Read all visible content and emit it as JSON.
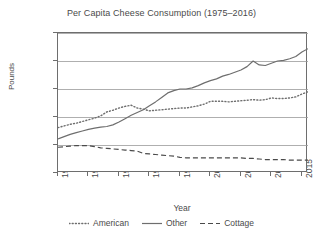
{
  "chart_data": {
    "type": "line",
    "title": "Per Capita Cheese Consumption (1975–2016)",
    "xlabel": "Year",
    "ylabel": "Pounds",
    "xlim": [
      1975,
      2016
    ],
    "ylim": [
      0.0,
      25.0
    ],
    "grid": "horizontal",
    "legend_position": "bottom",
    "y_ticks": [
      "0.0",
      "5.0",
      "10.0",
      "15.0",
      "20.0",
      "25.0"
    ],
    "y_tick_values": [
      0.0,
      5.0,
      10.0,
      15.0,
      20.0,
      25.0
    ],
    "x_ticks": [
      "1975",
      "1980",
      "1985",
      "1990",
      "1995",
      "2000",
      "2005",
      "2010",
      "2015"
    ],
    "x_tick_values": [
      1975,
      1980,
      1985,
      1990,
      1995,
      2000,
      2005,
      2010,
      2015
    ],
    "x": [
      1975,
      1976,
      1977,
      1978,
      1979,
      1980,
      1981,
      1982,
      1983,
      1984,
      1985,
      1986,
      1987,
      1988,
      1989,
      1990,
      1991,
      1992,
      1993,
      1994,
      1995,
      1996,
      1997,
      1998,
      1999,
      2000,
      2001,
      2002,
      2003,
      2004,
      2005,
      2006,
      2007,
      2008,
      2009,
      2010,
      2011,
      2012,
      2013,
      2014,
      2015,
      2016
    ],
    "series": [
      {
        "name": "American",
        "style": "dotted",
        "color": "#6e6e6e",
        "values": [
          8.1,
          8.4,
          8.7,
          8.9,
          9.2,
          9.5,
          9.8,
          10.2,
          10.9,
          11.2,
          11.6,
          11.9,
          12.1,
          11.6,
          11.4,
          11.1,
          11.2,
          11.3,
          11.4,
          11.5,
          11.6,
          11.6,
          11.8,
          12.0,
          12.3,
          12.8,
          12.8,
          12.8,
          12.7,
          12.8,
          12.9,
          13.0,
          13.1,
          13.0,
          13.1,
          13.4,
          13.3,
          13.3,
          13.4,
          13.6,
          14.1,
          14.5
        ]
      },
      {
        "name": "Other",
        "style": "solid",
        "color": "#6e6e6e",
        "values": [
          6.1,
          6.5,
          6.9,
          7.2,
          7.5,
          7.8,
          8.0,
          8.2,
          8.3,
          8.6,
          9.1,
          9.7,
          10.3,
          10.8,
          11.3,
          12.0,
          12.7,
          13.5,
          14.3,
          14.7,
          15.0,
          15.0,
          15.2,
          15.6,
          16.1,
          16.5,
          16.8,
          17.3,
          17.6,
          18.0,
          18.4,
          19.0,
          20.0,
          19.3,
          19.2,
          19.6,
          20.0,
          20.1,
          20.4,
          20.8,
          21.6,
          22.2
        ]
      },
      {
        "name": "Cottage",
        "style": "dashed",
        "color": "#4a4a4a",
        "values": [
          4.6,
          4.7,
          4.8,
          4.9,
          4.9,
          4.9,
          4.7,
          4.5,
          4.4,
          4.3,
          4.2,
          4.1,
          4.0,
          3.9,
          3.5,
          3.4,
          3.3,
          3.2,
          3.1,
          3.0,
          2.8,
          2.7,
          2.7,
          2.7,
          2.7,
          2.7,
          2.7,
          2.7,
          2.7,
          2.7,
          2.7,
          2.6,
          2.6,
          2.5,
          2.4,
          2.4,
          2.4,
          2.4,
          2.3,
          2.3,
          2.3,
          2.3
        ]
      }
    ]
  },
  "legend": {
    "items": [
      {
        "label": "American",
        "style": "dotted"
      },
      {
        "label": "Other",
        "style": "solid"
      },
      {
        "label": "Cottage",
        "style": "dashed"
      }
    ]
  }
}
